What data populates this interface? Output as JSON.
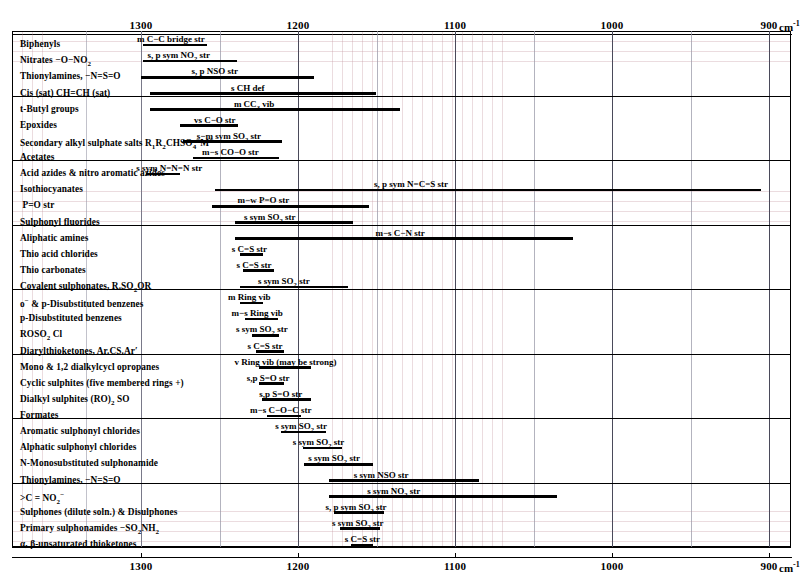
{
  "chart_data": {
    "type": "bar",
    "xlabel": "cm",
    "xlabel_sup": "-1",
    "axis": {
      "min": 900,
      "max": 1310,
      "ticks": [
        1300,
        1200,
        1100,
        1000,
        900
      ],
      "tick_labels": [
        "1300",
        "1200",
        "1100",
        "1000",
        "900"
      ],
      "minor_step": 10,
      "grid": true,
      "direction": "descending"
    },
    "rows": [
      {
        "label": "Biphenyls",
        "label_html": "Biphenyls",
        "bar_start": 1299,
        "bar_end": 1258,
        "annotation": "m  C−C bridge str",
        "ann_center": 1281,
        "group_end": false
      },
      {
        "label": "Nitrates -O-NO2",
        "label_html": "Nitrates −O−NO<sub>2</sub>",
        "bar_start": 1299,
        "bar_end": 1239,
        "annotation": "s, p sym NO<sub>2</sub> str",
        "ann_center": 1276,
        "group_end": false
      },
      {
        "label": "Thionylamines, -N=S=O",
        "label_html": "Thionylamines, −N=S=O",
        "bar_start": 1300,
        "bar_end": 1190,
        "annotation": "s, p NSO str",
        "ann_center": 1253,
        "group_end": false
      },
      {
        "label": "Cis (sat) CH=CH (sat)",
        "label_html": "Cis (sat) CH=CH (sat)",
        "bar_start": 1294,
        "bar_end": 1150,
        "annotation": "s CH def",
        "ann_center": 1232,
        "group_end": true
      },
      {
        "label": "t-Butyl groups",
        "label_html": "t-Butyl groups",
        "bar_start": 1294,
        "bar_end": 1135,
        "annotation": "m  CC<sub>3</sub> vib",
        "ann_center": 1228,
        "group_end": false
      },
      {
        "label": "Epoxides",
        "label_html": "Epoxides",
        "bar_start": 1275,
        "bar_end": 1238,
        "annotation": "vs  C−O str",
        "ann_center": 1253,
        "group_end": false
      },
      {
        "label": "Secondary alkyl sulphate salts R1R2CHSO4-M+",
        "label_html": "Secondary alkyl sulphate salts R<sub>1</sub>R<sub>2</sub>CHSO<sub>4</sub><sup>−</sup>M<sup>+</sup>",
        "bar_start": 1273,
        "bar_end": 1210,
        "annotation": "s−m sym SO<sub>2</sub> str",
        "ann_center": 1244,
        "group_end": false
      },
      {
        "label": "Acetates",
        "label_html": "Acetates",
        "bar_start": 1267,
        "bar_end": 1212,
        "annotation": "m−s CO−O str",
        "ann_center": 1243,
        "group_end": true
      },
      {
        "label": "Acid azides & nitro aromatic azides",
        "label_html": "Acid azides &amp; nitro aromatic azides",
        "bar_start": 1297,
        "bar_end": 1275,
        "annotation": "s sym N=N=N str",
        "ann_center": 1282,
        "group_end": false
      },
      {
        "label": "Isothiocyanates",
        "label_html": "Isothiocyanates",
        "bar_start": 1253,
        "bar_end": 905,
        "annotation": "s, p sym  N=C=S str",
        "ann_center": 1128,
        "group_end": false
      },
      {
        "label": "P=O str",
        "label_html": "&nbsp;P=O str",
        "bar_start": 1255,
        "bar_end": 1155,
        "annotation": "m−w P=O str",
        "ann_center": 1222,
        "group_end": false
      },
      {
        "label": "Sulphonyl fluorides",
        "label_html": "Sulphonyl fluorides",
        "bar_start": 1240,
        "bar_end": 1165,
        "annotation": "s sym SO<sub>2</sub> str",
        "ann_center": 1218,
        "group_end": true
      },
      {
        "label": "Aliphatic amines",
        "label_html": "Aliphatic amines",
        "bar_start": 1240,
        "bar_end": 1025,
        "annotation": "m−s C−N str",
        "ann_center": 1135,
        "group_end": false
      },
      {
        "label": "Thio acid chlorides",
        "label_html": "Thio acid chlorides",
        "bar_start": 1237,
        "bar_end": 1222,
        "annotation": "s C=S str",
        "ann_center": 1231,
        "group_end": false
      },
      {
        "label": "Thio carbonates",
        "label_html": "Thio carbonates",
        "bar_start": 1235,
        "bar_end": 1215,
        "annotation": "s C=S str",
        "ann_center": 1228,
        "group_end": false
      },
      {
        "label": "Covalent sulphonates, R.SO2OR",
        "label_html": "Covalent sulphonates, R.SO<sub>2</sub>OR",
        "bar_start": 1237,
        "bar_end": 1168,
        "annotation": "s sym SO<sub>2</sub> str",
        "ann_center": 1209,
        "group_end": true
      },
      {
        "label": "o- & p-Disubstituted benzenes",
        "label_html": "o<sup>−</sup> &amp; p-Disubstituted benzenes",
        "bar_start": 1237,
        "bar_end": 1222,
        "annotation": "m Ring vib",
        "ann_center": 1231,
        "group_end": false
      },
      {
        "label": "p-Disubstituted benzenes",
        "label_html": "p-Disubstituted benzenes",
        "bar_start": 1234,
        "bar_end": 1213,
        "annotation": "m−s Ring vib",
        "ann_center": 1226,
        "group_end": false
      },
      {
        "label": "ROSO2 Cl",
        "label_html": "ROSO<sub>2</sub> Cl",
        "bar_start": 1229,
        "bar_end": 1212,
        "annotation": "s sym SO<sub>2</sub> str",
        "ann_center": 1223,
        "group_end": false
      },
      {
        "label": "Diarylthioketones, Ar.CS.Ar'",
        "label_html": "Diarylthioketones, Ar.CS.Ar′",
        "bar_start": 1227,
        "bar_end": 1209,
        "annotation": "s C=S str",
        "ann_center": 1221,
        "group_end": true
      },
      {
        "label": "Mono & 1,2 dialkylcyclopropanes",
        "label_html": "Mono &amp; 1,2 dialkylcycl opropanes",
        "bar_start": 1225,
        "bar_end": 1192,
        "annotation": "v Ring vib (may be strong)",
        "ann_center": 1208,
        "group_end": false
      },
      {
        "label": "Cyclic sulphites (five membered rings +)",
        "label_html": "Cyclic sulphites (five membered rings +)",
        "bar_start": 1225,
        "bar_end": 1209,
        "annotation": "s,p S=O str",
        "ann_center": 1219,
        "group_end": false
      },
      {
        "label": "Dialkyl sulphites (RO)2 SO",
        "label_html": "Dialkyl sulphites (RO)<sub>2</sub> SO",
        "bar_start": 1223,
        "bar_end": 1192,
        "annotation": "s,p S=O str",
        "ann_center": 1211,
        "group_end": false
      },
      {
        "label": "Formates",
        "label_html": "Formates",
        "bar_start": 1220,
        "bar_end": 1198,
        "annotation": "m−s   C−O−C str",
        "ann_center": 1211,
        "group_end": true
      },
      {
        "label": "Aromatic sulphonyl chlorides",
        "label_html": "Aromatic sulphonyl chlorides",
        "bar_start": 1211,
        "bar_end": 1182,
        "annotation": "s sym SO<sub>2</sub> str",
        "ann_center": 1198,
        "group_end": false
      },
      {
        "label": "Alphatic sulphonyl chlorides",
        "label_html": "Alphatic sulphonyl chlorides",
        "bar_start": 1197,
        "bar_end": 1172,
        "annotation": "s sym SO<sub>2</sub> str",
        "ann_center": 1187,
        "group_end": false
      },
      {
        "label": "N-Monosubstituted sulphonamide",
        "label_html": "N-Monosubstituted sulphonamide",
        "bar_start": 1196,
        "bar_end": 1152,
        "annotation": "s sym SO<sub>2</sub> str",
        "ann_center": 1177,
        "group_end": false
      },
      {
        "label": "Thionylamines, -N=S=O",
        "label_html": "Thionylamines, −N=S=O",
        "bar_start": 1180,
        "bar_end": 1085,
        "annotation": "s sym NSO str",
        "ann_center": 1147,
        "group_end": true
      },
      {
        "label": ">C=NO2-",
        "label_html": "&gt;C = NO<sub>2</sub><sup>−</sup>",
        "bar_start": 1180,
        "bar_end": 1035,
        "annotation": "s sym NO<sub>2</sub> str",
        "ann_center": 1139,
        "group_end": false
      },
      {
        "label": "Sulphones (dilute soln.) & Disulphones",
        "label_html": "Sulphones (dilute soln.) &amp; Disulphones",
        "bar_start": 1177,
        "bar_end": 1145,
        "annotation": "s, p sym SO<sub>2</sub> str",
        "ann_center": 1163,
        "group_end": false
      },
      {
        "label": "Primary sulphonamides -SO2NH2",
        "label_html": "Primary sulphonamides −SO<sub>2</sub>NH<sub>2</sub>",
        "bar_start": 1173,
        "bar_end": 1148,
        "annotation": "s sym SO<sub>2</sub> str",
        "ann_center": 1162,
        "group_end": false
      },
      {
        "label": "alpha, beta-unsaturated thioketones",
        "label_html": "α, β-unsaturated thioketones",
        "bar_start": 1166,
        "bar_end": 1152,
        "annotation": "s C=S str",
        "ann_center": 1159,
        "group_end": true
      }
    ]
  }
}
